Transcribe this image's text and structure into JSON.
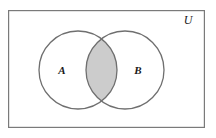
{
  "diagram": {
    "type": "venn-diagram",
    "universe": {
      "label": "U",
      "label_x": 188,
      "label_y": 24,
      "rect": {
        "x": 8,
        "y": 10,
        "width": 197,
        "height": 118
      },
      "fill": "#ffffff",
      "stroke": "#7a7a7a",
      "stroke_width": 1.2
    },
    "sets": [
      {
        "name": "set-a",
        "label": "A",
        "label_x": 62,
        "label_y": 74,
        "cx": 78,
        "cy": 70,
        "r": 39,
        "fill": "#ffffff",
        "stroke": "#6f6f6f",
        "stroke_width": 1.3
      },
      {
        "name": "set-b",
        "label": "B",
        "label_x": 138,
        "label_y": 74,
        "cx": 125,
        "cy": 70,
        "r": 39,
        "fill": "#ffffff",
        "stroke": "#6f6f6f",
        "stroke_width": 1.3
      }
    ],
    "intersection": {
      "name": "a-intersect-b",
      "shaded": true,
      "fill": "#cccccc",
      "stroke": "#6f6f6f",
      "top_point": {
        "x": 101.5,
        "y": 37
      },
      "bottom_point": {
        "x": 101.5,
        "y": 103
      }
    },
    "colors": {
      "background": "#ffffff",
      "frame_stroke": "#7a7a7a",
      "circle_stroke": "#6f6f6f",
      "shade_fill": "#cccccc",
      "text": "#1a1a1a"
    }
  }
}
